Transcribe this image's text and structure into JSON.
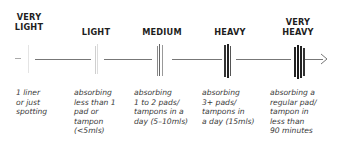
{
  "diagram": {
    "title": "",
    "levels": [
      {
        "label": "VERY\nLIGHT",
        "description": "1 liner\nor just\nspotting",
        "tick_count": 1
      },
      {
        "label": "LIGHT",
        "description": "absorbing\nless than 1\npad or\ntampon\n(<5mls)",
        "tick_count": 2
      },
      {
        "label": "MEDIUM",
        "description": "absorbing\n1 to 2 pads/\ntampons in a\nday (5–10mls)",
        "tick_count": 3
      },
      {
        "label": "HEAVY",
        "description": "absorbing\n3+ pads/\ntampons in\na day (15mls)",
        "tick_count": 3
      },
      {
        "label": "VERY\nHEAVY",
        "description": "absorbing a\nregular pad/\ntampon in\nless than\n90 minutes",
        "tick_count": 4
      }
    ],
    "axis": {
      "direction": "right",
      "end_marker": "arrow"
    },
    "colors": {
      "line": "#777777",
      "text": "#1e1e1e",
      "tick_faint": "#d8d8d8",
      "tick_dark": "#333333"
    }
  }
}
